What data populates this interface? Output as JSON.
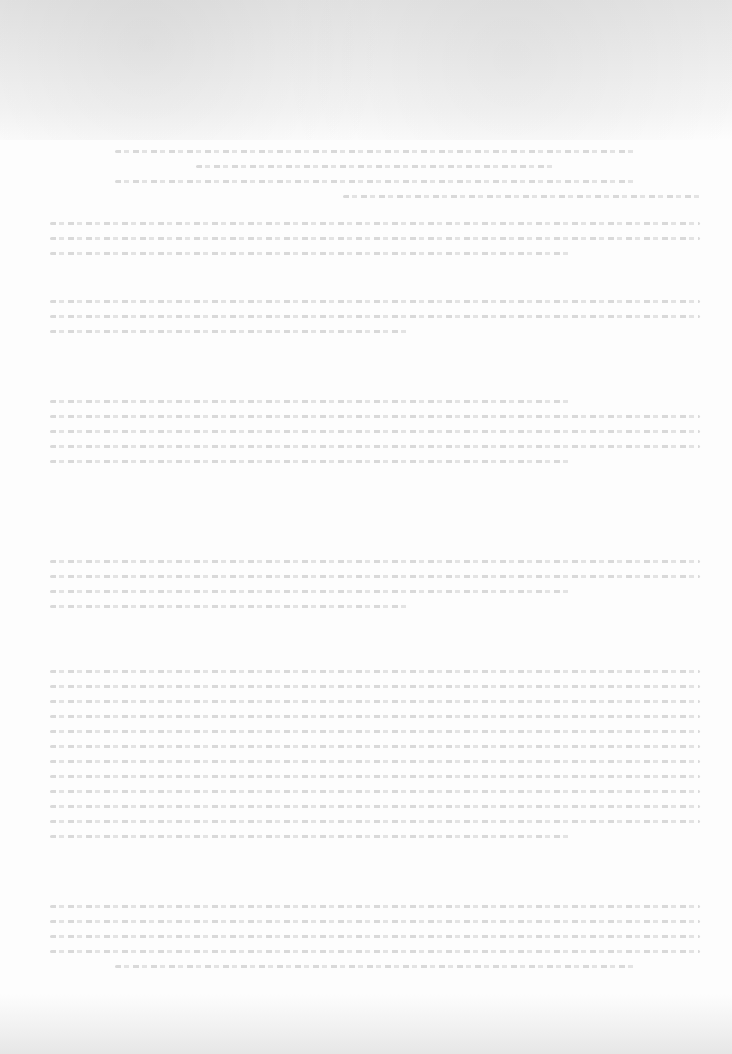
{
  "page": {
    "type": "scanned-document",
    "legible": false,
    "title": "",
    "blocks": [
      {
        "id": "header",
        "lines": 4,
        "text": ""
      },
      {
        "id": "para-1",
        "lines": 3,
        "text": ""
      },
      {
        "id": "para-2",
        "lines": 3,
        "text": ""
      },
      {
        "id": "para-3",
        "lines": 5,
        "text": ""
      },
      {
        "id": "para-4",
        "lines": 4,
        "text": ""
      },
      {
        "id": "para-5",
        "lines": 12,
        "text": ""
      },
      {
        "id": "para-6",
        "lines": 5,
        "text": ""
      }
    ]
  },
  "colors": {
    "paper": "#fdfdfd",
    "top_band": "#e4e4e4",
    "ink_faded": "#969696"
  }
}
